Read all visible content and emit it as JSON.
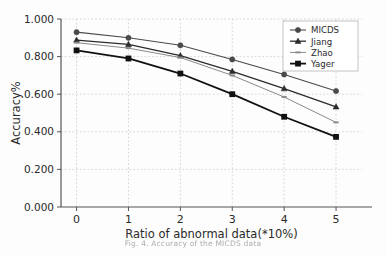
{
  "figure": {
    "caption": "Fig. 4.  Accuracy of the MICDS data"
  },
  "chart_data": {
    "type": "line",
    "title": "",
    "xlabel": "Ratio of abnormal data(*10%)",
    "ylabel": "Accuracy%",
    "x": [
      0,
      1,
      2,
      3,
      4,
      5
    ],
    "xticklabels": [
      "0",
      "1",
      "2",
      "3",
      "4",
      "5"
    ],
    "yticklabels": [
      "0.000",
      "0.200",
      "0.400",
      "0.600",
      "0.800",
      "1.000"
    ],
    "yticks": [
      0.0,
      0.2,
      0.4,
      0.6,
      0.8,
      1.0
    ],
    "xlim": [
      -0.3,
      5.5
    ],
    "ylim": [
      0.0,
      1.0
    ],
    "grid": true,
    "grid_style": "dotted",
    "legend_position": "upper-right",
    "series": [
      {
        "name": "MICDS",
        "marker": "circle-marker",
        "color": "#4a4a4a",
        "linewidth": 1.1,
        "values": [
          0.93,
          0.9,
          0.86,
          0.785,
          0.705,
          0.617
        ]
      },
      {
        "name": "Jiang",
        "marker": "triangle-marker",
        "color": "#2b2b2b",
        "linewidth": 1.3,
        "values": [
          0.888,
          0.865,
          0.805,
          0.722,
          0.63,
          0.533
        ]
      },
      {
        "name": "Zhao",
        "marker": "dash-marker",
        "color": "#8a8a8a",
        "linewidth": 1.0,
        "values": [
          0.874,
          0.845,
          0.795,
          0.7,
          0.585,
          0.45
        ]
      },
      {
        "name": "Yager",
        "marker": "square-marker",
        "color": "#111111",
        "linewidth": 1.8,
        "values": [
          0.833,
          0.79,
          0.71,
          0.6,
          0.48,
          0.373
        ]
      }
    ]
  },
  "axes": {
    "axis_color": "#555555",
    "grid_color": "#c9c9c9",
    "tick_label_color": "#2a2a2a"
  },
  "legend": {
    "entries": [
      "MICDS",
      "Jiang",
      "Zhao",
      "Yager"
    ],
    "border_color": "#b5b5b5",
    "background": "#ffffff"
  }
}
